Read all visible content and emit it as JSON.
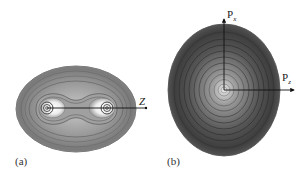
{
  "figure": {
    "panels": [
      {
        "id": "a",
        "label": "(a)",
        "description": "Position-space electron density contours of a diatomic molecule",
        "axis": {
          "label": "Z"
        }
      },
      {
        "id": "b",
        "label": "(b)",
        "description": "Momentum-space density contours",
        "axes": {
          "vertical": {
            "base": "P",
            "sub": "x"
          },
          "horizontal": {
            "base": "P",
            "sub": "z"
          }
        }
      }
    ],
    "colors": {
      "background": "#ffffff",
      "outer_shade": "#6e6e6e",
      "mid_shade": "#8a8a8a",
      "inner_light": "#d8d8d8",
      "contour_line": "#4a4a4a",
      "axis": "#111111"
    }
  }
}
